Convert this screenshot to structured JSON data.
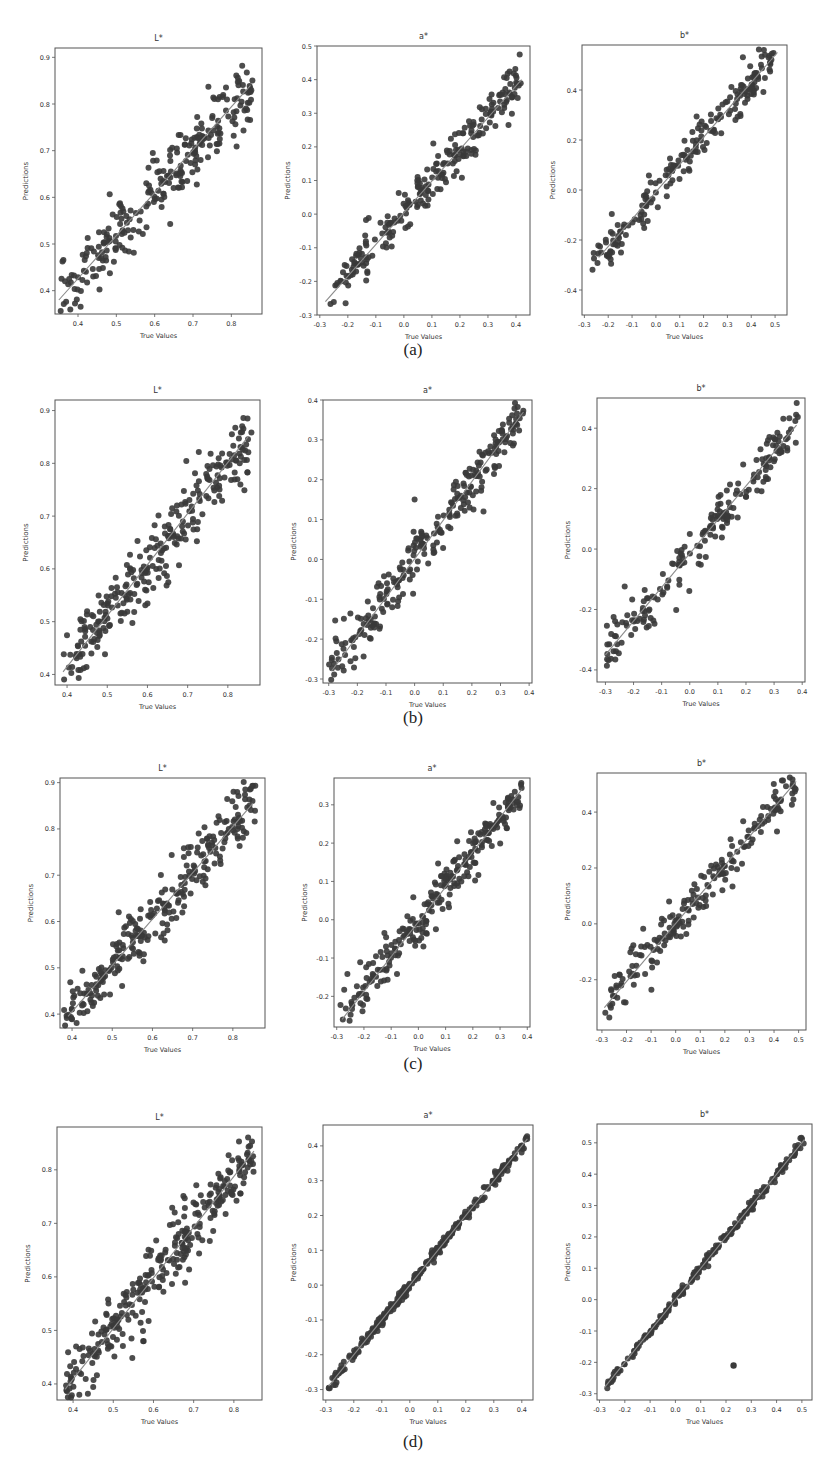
{
  "figure": {
    "captions": [
      "(a)",
      "(b)",
      "(c)",
      "(d)"
    ],
    "xlabel": "True Values",
    "ylabel": "Predictions",
    "marker_color": "#3a3a3a",
    "line_color": "#8a8a8a"
  },
  "chart_data": [
    {
      "type": "scatter",
      "row": "a",
      "title": "L*",
      "xlabel": "True Values",
      "ylabel": "Predictions",
      "xlim": [
        0.34,
        0.88
      ],
      "ylim": [
        0.35,
        0.92
      ],
      "xticks": [
        0.4,
        0.5,
        0.6,
        0.7,
        0.8
      ],
      "yticks": [
        0.4,
        0.5,
        0.6,
        0.7,
        0.8,
        0.9
      ],
      "xticklabels": [
        "0.4",
        "0.5",
        "0.6",
        "0.7",
        "0.8"
      ],
      "yticklabels": [
        "0.4",
        "0.5",
        "0.6",
        "0.7",
        "0.8",
        "0.9"
      ],
      "fit_line": {
        "x": [
          0.35,
          0.85
        ],
        "y": [
          0.38,
          0.84
        ]
      },
      "points_summary": {
        "n": 260,
        "x_range": [
          0.35,
          0.86
        ],
        "spread": 0.035,
        "bias_slope": 1.05
      },
      "frame_px": [
        55,
        48,
        262,
        314
      ]
    },
    {
      "type": "scatter",
      "row": "a",
      "title": "a*",
      "xlabel": "True Values",
      "ylabel": "Predictions",
      "xlim": [
        -0.31,
        0.45
      ],
      "ylim": [
        -0.3,
        0.5
      ],
      "xticks": [
        -0.3,
        -0.2,
        -0.1,
        0.0,
        0.1,
        0.2,
        0.3,
        0.4
      ],
      "yticks": [
        -0.3,
        -0.2,
        -0.1,
        0.0,
        0.1,
        0.2,
        0.3,
        0.4,
        0.5
      ],
      "xticklabels": [
        "-0.3",
        "-0.2",
        "-0.1",
        "0.0",
        "0.1",
        "0.2",
        "0.3",
        "0.4"
      ],
      "yticklabels": [
        "-0.3",
        "-0.2",
        "-0.1",
        "0.0",
        "0.1",
        "0.2",
        "0.3",
        "0.4",
        "0.5"
      ],
      "fit_line": {
        "x": [
          -0.28,
          0.42
        ],
        "y": [
          -0.26,
          0.4
        ]
      },
      "points_summary": {
        "n": 240,
        "x_range": [
          -0.28,
          0.42
        ],
        "spread": 0.035,
        "bias_slope": 1.0
      },
      "frame_px": [
        317,
        46,
        530,
        315
      ]
    },
    {
      "type": "scatter",
      "row": "a",
      "title": "b*",
      "xlabel": "True Values",
      "ylabel": "Predictions",
      "xlim": [
        -0.31,
        0.55
      ],
      "ylim": [
        -0.5,
        0.58
      ],
      "xticks": [
        -0.3,
        -0.2,
        -0.1,
        0.0,
        0.1,
        0.2,
        0.3,
        0.4,
        0.5
      ],
      "yticks": [
        -0.4,
        -0.2,
        0.0,
        0.2,
        0.4
      ],
      "xticklabels": [
        "-0.3",
        "-0.2",
        "-0.1",
        "0.0",
        "0.1",
        "0.2",
        "0.3",
        "0.4",
        "0.5"
      ],
      "yticklabels": [
        "-0.4",
        "-0.2",
        "0.0",
        "0.2",
        "0.4"
      ],
      "fit_line": {
        "x": [
          -0.24,
          0.51
        ],
        "y": [
          -0.27,
          0.55
        ]
      },
      "points_summary": {
        "n": 200,
        "x_range": [
          -0.27,
          0.51
        ],
        "spread": 0.045,
        "bias_slope": 1.0
      },
      "frame_px": [
        582,
        45,
        787,
        315
      ]
    },
    {
      "type": "scatter",
      "row": "b",
      "title": "L*",
      "xlabel": "True Values",
      "ylabel": "Predictions",
      "xlim": [
        0.37,
        0.88
      ],
      "ylim": [
        0.38,
        0.92
      ],
      "xticks": [
        0.4,
        0.5,
        0.6,
        0.7,
        0.8
      ],
      "yticks": [
        0.4,
        0.5,
        0.6,
        0.7,
        0.8,
        0.9
      ],
      "xticklabels": [
        "0.4",
        "0.5",
        "0.6",
        "0.7",
        "0.8"
      ],
      "yticklabels": [
        "0.4",
        "0.5",
        "0.6",
        "0.7",
        "0.8",
        "0.9"
      ],
      "fit_line": {
        "x": [
          0.39,
          0.85
        ],
        "y": [
          0.405,
          0.85
        ]
      },
      "points_summary": {
        "n": 280,
        "x_range": [
          0.39,
          0.86
        ],
        "spread": 0.035,
        "bias_slope": 1.0
      },
      "frame_px": [
        55,
        400,
        260,
        685
      ]
    },
    {
      "type": "scatter",
      "row": "b",
      "title": "a*",
      "xlabel": "True Values",
      "ylabel": "Predictions",
      "xlim": [
        -0.32,
        0.41
      ],
      "ylim": [
        -0.31,
        0.4
      ],
      "xticks": [
        -0.3,
        -0.2,
        -0.1,
        0.0,
        0.1,
        0.2,
        0.3,
        0.4
      ],
      "yticks": [
        -0.3,
        -0.2,
        -0.1,
        0.0,
        0.1,
        0.2,
        0.3,
        0.4
      ],
      "xticklabels": [
        "-0.3",
        "-0.2",
        "-0.1",
        "0.0",
        "0.1",
        "0.2",
        "0.3",
        "0.4"
      ],
      "yticklabels": [
        "-0.3",
        "-0.2",
        "-0.1",
        "0.0",
        "0.1",
        "0.2",
        "0.3",
        "0.4"
      ],
      "fit_line": {
        "x": [
          -0.29,
          0.38
        ],
        "y": [
          -0.28,
          0.37
        ]
      },
      "points_summary": {
        "n": 260,
        "x_range": [
          -0.3,
          0.38
        ],
        "spread": 0.035,
        "bias_slope": 1.0
      },
      "frame_px": [
        323,
        400,
        532,
        683
      ]
    },
    {
      "type": "scatter",
      "row": "b",
      "title": "b*",
      "xlabel": "True Values",
      "ylabel": "Predictions",
      "xlim": [
        -0.33,
        0.41
      ],
      "ylim": [
        -0.44,
        0.5
      ],
      "xticks": [
        -0.3,
        -0.2,
        -0.1,
        0.0,
        0.1,
        0.2,
        0.3,
        0.4
      ],
      "yticks": [
        -0.4,
        -0.2,
        0.0,
        0.2,
        0.4
      ],
      "xticklabels": [
        "-0.3",
        "-0.2",
        "-0.1",
        "0.0",
        "0.1",
        "0.2",
        "0.3",
        "0.4"
      ],
      "yticklabels": [
        "-0.4",
        "-0.2",
        "0.0",
        "0.2",
        "0.4"
      ],
      "fit_line": {
        "x": [
          -0.3,
          0.38
        ],
        "y": [
          -0.35,
          0.41
        ]
      },
      "points_summary": {
        "n": 200,
        "x_range": [
          -0.3,
          0.39
        ],
        "spread": 0.04,
        "bias_slope": 1.0
      },
      "frame_px": [
        597,
        398,
        805,
        682
      ]
    },
    {
      "type": "scatter",
      "row": "c",
      "title": "L*",
      "xlabel": "True Values",
      "ylabel": "Predictions",
      "xlim": [
        0.37,
        0.88
      ],
      "ylim": [
        0.37,
        0.91
      ],
      "xticks": [
        0.4,
        0.5,
        0.6,
        0.7,
        0.8
      ],
      "yticks": [
        0.4,
        0.5,
        0.6,
        0.7,
        0.8,
        0.9
      ],
      "xticklabels": [
        "0.4",
        "0.5",
        "0.6",
        "0.7",
        "0.8"
      ],
      "yticklabels": [
        "0.4",
        "0.5",
        "0.6",
        "0.7",
        "0.8",
        "0.9"
      ],
      "fit_line": {
        "x": [
          0.39,
          0.85
        ],
        "y": [
          0.395,
          0.855
        ]
      },
      "points_summary": {
        "n": 280,
        "x_range": [
          0.38,
          0.86
        ],
        "spread": 0.035,
        "bias_slope": 1.0
      },
      "frame_px": [
        60,
        778,
        265,
        1028
      ]
    },
    {
      "type": "scatter",
      "row": "c",
      "title": "a*",
      "xlabel": "True Values",
      "ylabel": "Predictions",
      "xlim": [
        -0.31,
        0.41
      ],
      "ylim": [
        -0.28,
        0.37
      ],
      "xticks": [
        -0.3,
        -0.2,
        -0.1,
        0.0,
        0.1,
        0.2,
        0.3,
        0.4
      ],
      "yticks": [
        -0.2,
        -0.1,
        0.0,
        0.1,
        0.2,
        0.3
      ],
      "xticklabels": [
        "-0.3",
        "-0.2",
        "-0.1",
        "0.0",
        "0.1",
        "0.2",
        "0.3",
        "0.4"
      ],
      "yticklabels": [
        "-0.2",
        "-0.1",
        "0.0",
        "0.1",
        "0.2",
        "0.3"
      ],
      "fit_line": {
        "x": [
          -0.28,
          0.38
        ],
        "y": [
          -0.26,
          0.34
        ]
      },
      "points_summary": {
        "n": 260,
        "x_range": [
          -0.29,
          0.38
        ],
        "spread": 0.03,
        "bias_slope": 1.0
      },
      "frame_px": [
        334,
        778,
        530,
        1027
      ]
    },
    {
      "type": "scatter",
      "row": "c",
      "title": "b*",
      "xlabel": "True Values",
      "ylabel": "Predictions",
      "xlim": [
        -0.32,
        0.53
      ],
      "ylim": [
        -0.38,
        0.54
      ],
      "xticks": [
        -0.3,
        -0.2,
        -0.1,
        0.0,
        0.1,
        0.2,
        0.3,
        0.4,
        0.5
      ],
      "yticks": [
        -0.2,
        0.0,
        0.2,
        0.4
      ],
      "xticklabels": [
        "-0.3",
        "-0.2",
        "-0.1",
        "0.0",
        "0.1",
        "0.2",
        "0.3",
        "0.4",
        "0.5"
      ],
      "yticklabels": [
        "-0.2",
        "0.0",
        "0.2",
        "0.4"
      ],
      "fit_line": {
        "x": [
          -0.29,
          0.49
        ],
        "y": [
          -0.3,
          0.51
        ]
      },
      "points_summary": {
        "n": 200,
        "x_range": [
          -0.29,
          0.49
        ],
        "spread": 0.04,
        "bias_slope": 1.0
      },
      "frame_px": [
        597,
        773,
        806,
        1030
      ]
    },
    {
      "type": "scatter",
      "row": "d",
      "title": "L*",
      "xlabel": "True Values",
      "ylabel": "Predictions",
      "xlim": [
        0.36,
        0.87
      ],
      "ylim": [
        0.37,
        0.88
      ],
      "xticks": [
        0.4,
        0.5,
        0.6,
        0.7,
        0.8
      ],
      "yticks": [
        0.4,
        0.5,
        0.6,
        0.7,
        0.8
      ],
      "xticklabels": [
        "0.4",
        "0.5",
        "0.6",
        "0.7",
        "0.8"
      ],
      "yticklabels": [
        "0.4",
        "0.5",
        "0.6",
        "0.7",
        "0.8"
      ],
      "fit_line": {
        "x": [
          0.38,
          0.85
        ],
        "y": [
          0.39,
          0.835
        ]
      },
      "points_summary": {
        "n": 300,
        "x_range": [
          0.38,
          0.85
        ],
        "spread": 0.03,
        "bias_slope": 1.0
      },
      "outliers": [
        {
          "x": 0.575,
          "y": 0.48
        }
      ],
      "frame_px": [
        57,
        1127,
        262,
        1400
      ]
    },
    {
      "type": "scatter",
      "row": "d",
      "title": "a*",
      "xlabel": "True Values",
      "ylabel": "Predictions",
      "xlim": [
        -0.31,
        0.44
      ],
      "ylim": [
        -0.33,
        0.46
      ],
      "xticks": [
        -0.3,
        -0.2,
        -0.1,
        0.0,
        0.1,
        0.2,
        0.3,
        0.4
      ],
      "yticks": [
        -0.3,
        -0.2,
        -0.1,
        0.0,
        0.1,
        0.2,
        0.3,
        0.4
      ],
      "xticklabels": [
        "-0.3",
        "-0.2",
        "-0.1",
        "0.0",
        "0.1",
        "0.2",
        "0.3",
        "0.4"
      ],
      "yticklabels": [
        "-0.3",
        "-0.2",
        "-0.1",
        "0.0",
        "0.1",
        "0.2",
        "0.3",
        "0.4"
      ],
      "fit_line": {
        "x": [
          -0.29,
          0.42
        ],
        "y": [
          -0.29,
          0.42
        ]
      },
      "points_summary": {
        "n": 280,
        "x_range": [
          -0.29,
          0.42
        ],
        "spread": 0.008,
        "bias_slope": 1.0
      },
      "frame_px": [
        323,
        1125,
        533,
        1400
      ]
    },
    {
      "type": "scatter",
      "row": "d",
      "title": "b*",
      "xlabel": "True Values",
      "ylabel": "Predictions",
      "xlim": [
        -0.31,
        0.54
      ],
      "ylim": [
        -0.32,
        0.56
      ],
      "xticks": [
        -0.3,
        -0.2,
        -0.1,
        0.0,
        0.1,
        0.2,
        0.3,
        0.4,
        0.5
      ],
      "yticks": [
        -0.3,
        -0.2,
        -0.1,
        0.0,
        0.1,
        0.2,
        0.3,
        0.4,
        0.5
      ],
      "xticklabels": [
        "-0.3",
        "-0.2",
        "-0.1",
        "0.0",
        "0.1",
        "0.2",
        "0.3",
        "0.4",
        "0.5"
      ],
      "yticklabels": [
        "-0.3",
        "-0.2",
        "-0.1",
        "0.0",
        "0.1",
        "0.2",
        "0.3",
        "0.4",
        "0.5"
      ],
      "fit_line": {
        "x": [
          -0.28,
          0.51
        ],
        "y": [
          -0.28,
          0.51
        ]
      },
      "points_summary": {
        "n": 240,
        "x_range": [
          -0.28,
          0.51
        ],
        "spread": 0.008,
        "bias_slope": 1.0
      },
      "outliers": [
        {
          "x": 0.23,
          "y": -0.21
        }
      ],
      "frame_px": [
        597,
        1124,
        812,
        1400
      ]
    }
  ],
  "caption_positions": [
    {
      "label": "(a)",
      "x": 413,
      "y": 340
    },
    {
      "label": "(b)",
      "x": 413,
      "y": 708
    },
    {
      "label": "(c)",
      "x": 413,
      "y": 1054
    },
    {
      "label": "(d)",
      "x": 413,
      "y": 1432
    }
  ]
}
